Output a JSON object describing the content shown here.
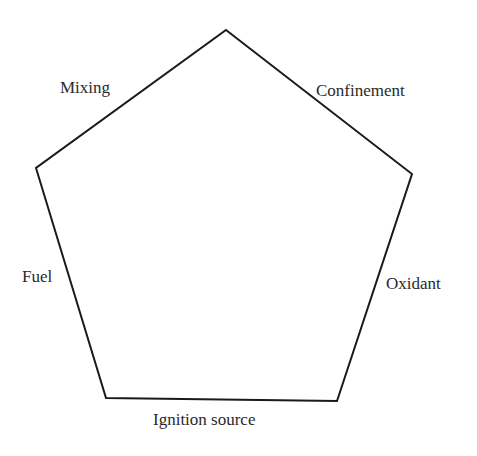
{
  "diagram": {
    "title": "",
    "shape": "pentagon",
    "line_color": "#1a1a1a",
    "labels": {
      "top_left": "Mixing",
      "top_right": "Confinement",
      "left": "Fuel",
      "right": "Oxidant",
      "bottom": "Ignition source"
    },
    "vertices": [
      [
        226,
        30
      ],
      [
        412,
        174
      ],
      [
        337,
        401
      ],
      [
        106,
        398
      ],
      [
        36,
        168
      ]
    ]
  }
}
